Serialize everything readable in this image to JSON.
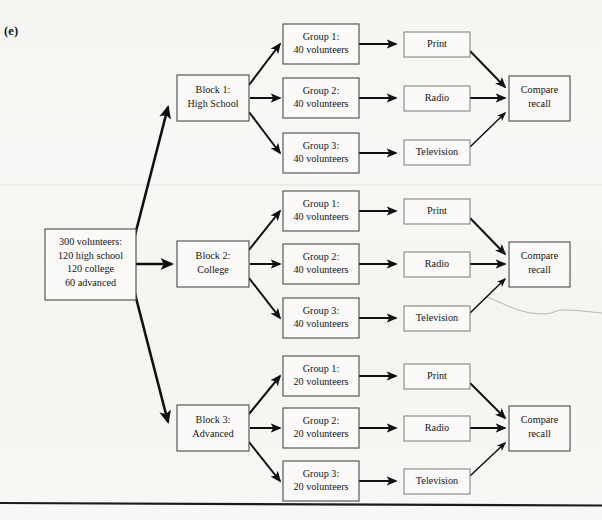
{
  "panel": {
    "label": "(e)"
  },
  "diagram": {
    "type": "experimental-design-flowchart",
    "root": {
      "name": "population-box",
      "lines": [
        "300 volunteers:",
        "120 high school",
        "120 college",
        "60 advanced"
      ]
    },
    "blocks": [
      {
        "name": "block-1",
        "lines": [
          "Block 1:",
          "High School"
        ],
        "groups": [
          {
            "name": "block1-group-1",
            "lines": [
              "Group 1:",
              "40 volunteers"
            ],
            "treatment": "Print"
          },
          {
            "name": "block1-group-2",
            "lines": [
              "Group 2:",
              "40 volunteers"
            ],
            "treatment": "Radio"
          },
          {
            "name": "block1-group-3",
            "lines": [
              "Group 3:",
              "40 volunteers"
            ],
            "treatment": "Television"
          }
        ],
        "outcome": {
          "name": "block1-outcome",
          "lines": [
            "Compare",
            "recall"
          ]
        }
      },
      {
        "name": "block-2",
        "lines": [
          "Block 2:",
          "College"
        ],
        "groups": [
          {
            "name": "block2-group-1",
            "lines": [
              "Group 1:",
              "40 volunteers"
            ],
            "treatment": "Print"
          },
          {
            "name": "block2-group-2",
            "lines": [
              "Group 2:",
              "40 volunteers"
            ],
            "treatment": "Radio"
          },
          {
            "name": "block2-group-3",
            "lines": [
              "Group 3:",
              "40 volunteers"
            ],
            "treatment": "Television"
          }
        ],
        "outcome": {
          "name": "block2-outcome",
          "lines": [
            "Compare",
            "recall"
          ]
        }
      },
      {
        "name": "block-3",
        "lines": [
          "Block 3:",
          "Advanced"
        ],
        "groups": [
          {
            "name": "block3-group-1",
            "lines": [
              "Group 1:",
              "20 volunteers"
            ],
            "treatment": "Print"
          },
          {
            "name": "block3-group-2",
            "lines": [
              "Group 2:",
              "20 volunteers"
            ],
            "treatment": "Radio"
          },
          {
            "name": "block3-group-3",
            "lines": [
              "Group 3:",
              "20 volunteers"
            ],
            "treatment": "Television"
          }
        ],
        "outcome": {
          "name": "block3-outcome",
          "lines": [
            "Compare",
            "recall"
          ]
        }
      }
    ]
  },
  "text": {
    "root_l1": "300 volunteers:",
    "root_l2": "120 high school",
    "root_l3": "120 college",
    "root_l4": "60 advanced",
    "b1_l1": "Block 1:",
    "b1_l2": "High School",
    "b2_l1": "Block 2:",
    "b2_l2": "College",
    "b3_l1": "Block 3:",
    "b3_l2": "Advanced",
    "b1g1_l1": "Group 1:",
    "b1g1_l2": "40 volunteers",
    "b1g2_l1": "Group 2:",
    "b1g2_l2": "40 volunteers",
    "b1g3_l1": "Group 3:",
    "b1g3_l2": "40 volunteers",
    "b2g1_l1": "Group 1:",
    "b2g1_l2": "40 volunteers",
    "b2g2_l1": "Group 2:",
    "b2g2_l2": "40 volunteers",
    "b2g3_l1": "Group 3:",
    "b2g3_l2": "40 volunteers",
    "b3g1_l1": "Group 1:",
    "b3g1_l2": "20 volunteers",
    "b3g2_l1": "Group 2:",
    "b3g2_l2": "20 volunteers",
    "b3g3_l1": "Group 3:",
    "b3g3_l2": "20 volunteers",
    "t1_print": "Print",
    "t1_radio": "Radio",
    "t1_tv": "Television",
    "t2_print": "Print",
    "t2_radio": "Radio",
    "t2_tv": "Television",
    "t3_print": "Print",
    "t3_radio": "Radio",
    "t3_tv": "Television",
    "o1_l1": "Compare",
    "o1_l2": "recall",
    "o2_l1": "Compare",
    "o2_l2": "recall",
    "o3_l1": "Compare",
    "o3_l2": "recall"
  },
  "colors": {
    "page_background": "#f7f6f4",
    "box_fill": "#fbfaf8",
    "box_stroke": "#4a4a4a",
    "arrow": "#101010",
    "text": "#141414",
    "rule": "#1b1b1b"
  }
}
